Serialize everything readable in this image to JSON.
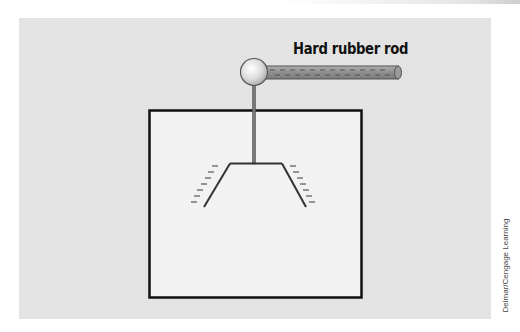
{
  "diagram": {
    "title_label": "Hard rubber rod",
    "credit": "Delmar/Cengage Learning",
    "components": [
      "hard-rubber-rod",
      "metal-sphere",
      "metal-rod",
      "glass-enclosure",
      "leaf-left",
      "leaf-right"
    ],
    "charge_symbols": "-",
    "colors": {
      "panel": "#e3e3e3",
      "enclosure_fill": "#f2f2f2",
      "rod": "#8a8a8a",
      "outline": "#111111"
    }
  }
}
